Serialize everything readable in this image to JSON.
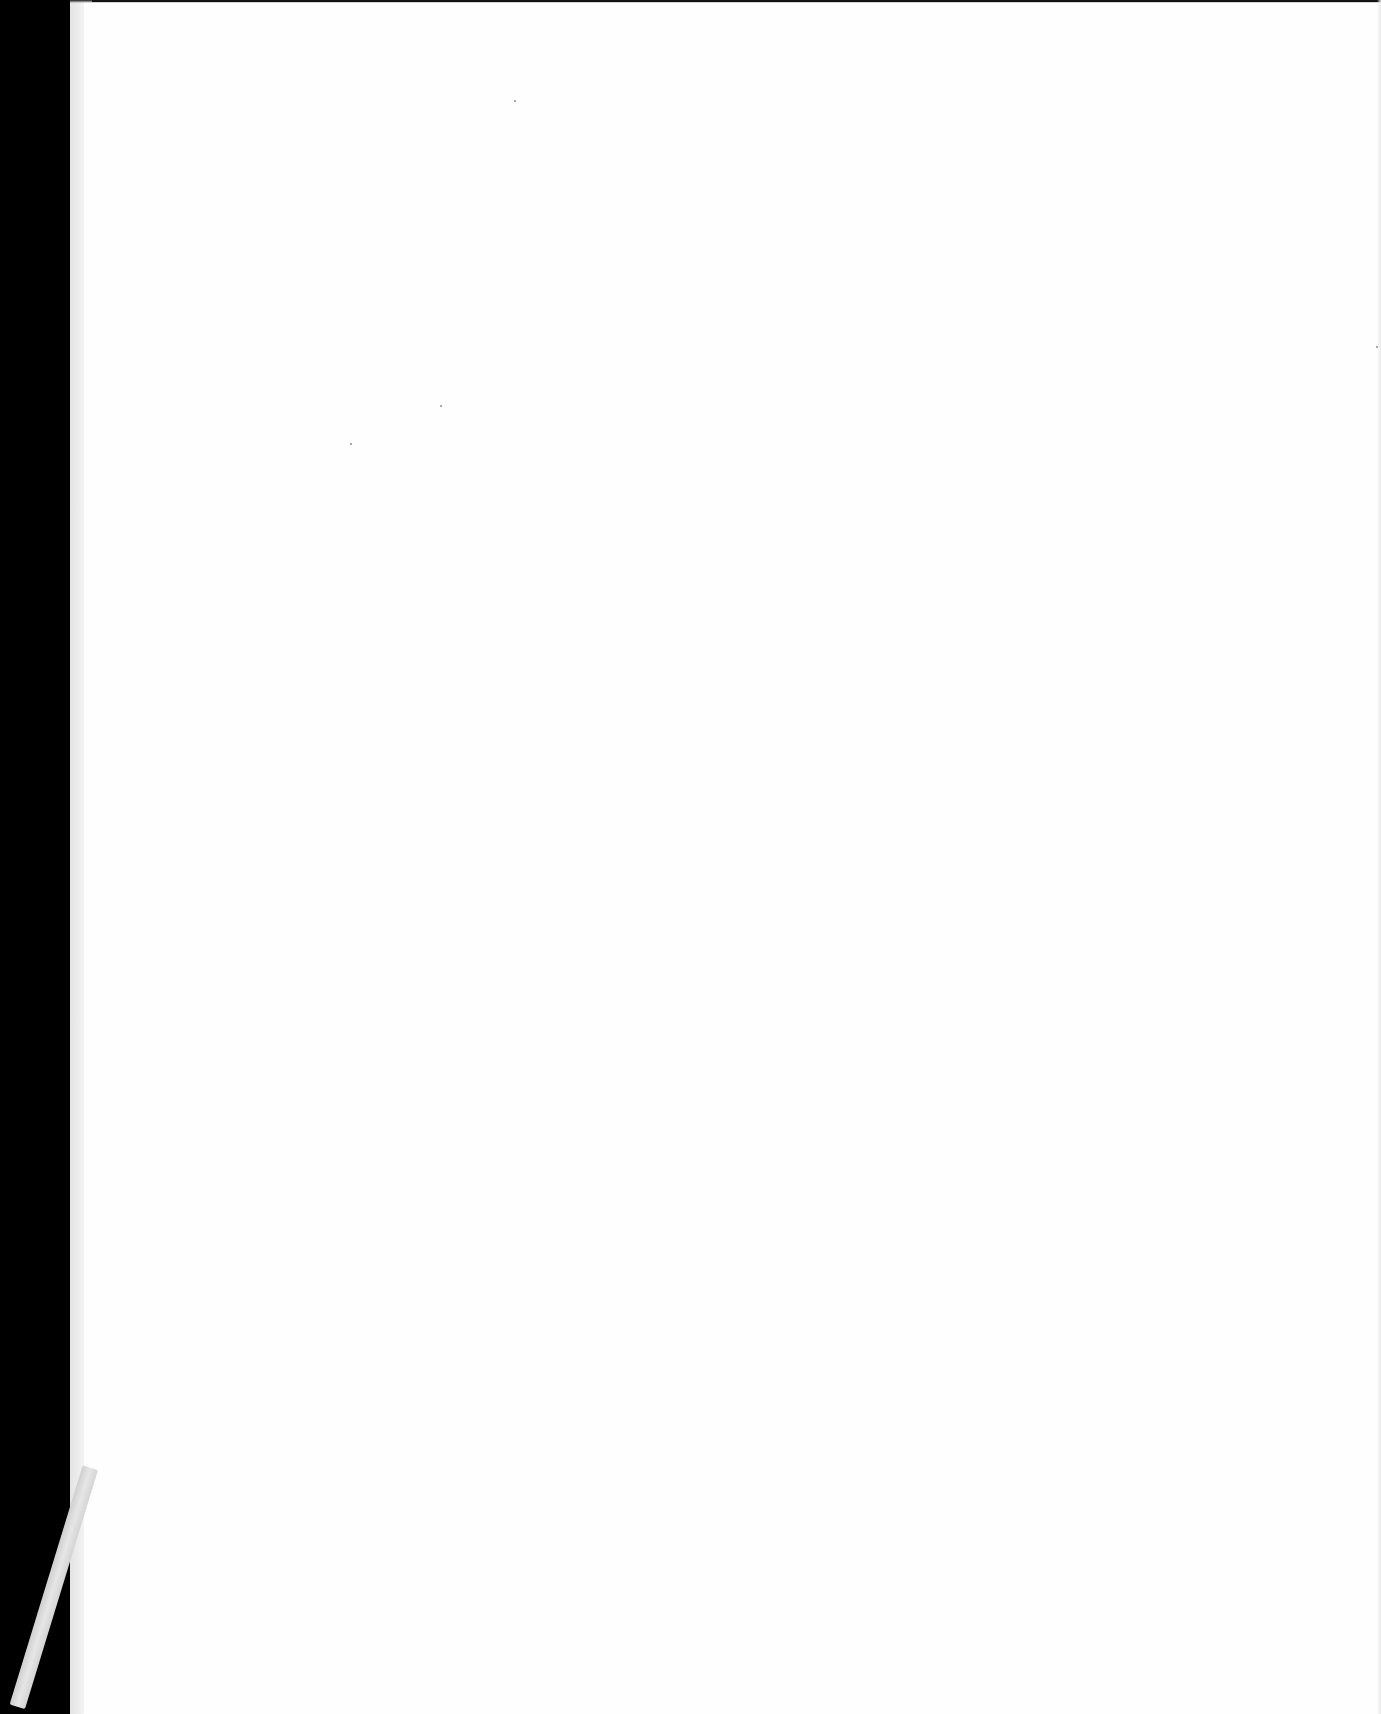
{
  "document": {
    "type": "scanned-page",
    "content_text": "",
    "colors": {
      "background": "#000000",
      "paper": "#fefefe",
      "page_edge": "#ececec",
      "ribbon": "#dadada"
    }
  }
}
